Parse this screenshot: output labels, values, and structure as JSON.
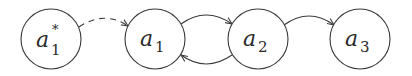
{
  "diagram": {
    "nodes": [
      {
        "id": "a1_star",
        "base": "a",
        "subscript": "1",
        "superscript": "*",
        "cx": 51,
        "cy": 39,
        "r": 30
      },
      {
        "id": "a1",
        "base": "a",
        "subscript": "1",
        "superscript": "",
        "cx": 155,
        "cy": 39,
        "r": 30
      },
      {
        "id": "a2",
        "base": "a",
        "subscript": "2",
        "superscript": "",
        "cx": 258,
        "cy": 39,
        "r": 30
      },
      {
        "id": "a3",
        "base": "a",
        "subscript": "3",
        "superscript": "",
        "cx": 360,
        "cy": 39,
        "r": 30
      }
    ],
    "edges": [
      {
        "from": "a1_star",
        "to": "a1",
        "style": "dashed"
      },
      {
        "from": "a1",
        "to": "a2",
        "style": "solid"
      },
      {
        "from": "a2",
        "to": "a1",
        "style": "solid"
      },
      {
        "from": "a2",
        "to": "a3",
        "style": "solid"
      }
    ],
    "colors": {
      "stroke": "#3a3a3a",
      "text": "#2a2a2a",
      "background": "#ffffff"
    }
  }
}
